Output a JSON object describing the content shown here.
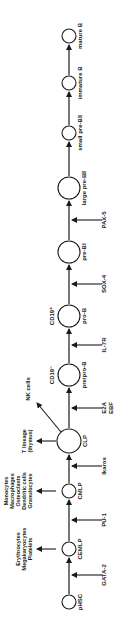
{
  "diagram": {
    "stages": [
      {
        "id": "pHSC",
        "label": "pHSC",
        "cy": 602,
        "r": 7
      },
      {
        "id": "CEMLP",
        "label": "CEMLP",
        "cy": 549,
        "r": 7
      },
      {
        "id": "CMLP",
        "label": "CMLP",
        "cy": 491,
        "r": 7
      },
      {
        "id": "CLP",
        "label": "CLP",
        "cy": 441,
        "r": 12
      },
      {
        "id": "prepro-B",
        "label": "pre/pro-B",
        "cy": 375,
        "r": 11,
        "marker": "CD19⁻"
      },
      {
        "id": "pro-B",
        "label": "pro-B",
        "cy": 316,
        "r": 11,
        "marker": "CD19⁺"
      },
      {
        "id": "pre-BI",
        "label": "pre-BⅠ",
        "cy": 252,
        "r": 11
      },
      {
        "id": "large-pre-BII",
        "label": "large pre-BⅡ",
        "cy": 188,
        "r": 11
      },
      {
        "id": "small-pre-BII",
        "label": "small pre-BⅡ",
        "cy": 133,
        "r": 7
      },
      {
        "id": "immature-B",
        "label": "immature B",
        "cy": 83,
        "r": 7
      },
      {
        "id": "mature-B",
        "label": "mature B",
        "cy": 36,
        "r": 7
      }
    ],
    "factors": [
      {
        "label": "GATA-2",
        "y": 575
      },
      {
        "label": "PU-1",
        "y": 520
      },
      {
        "label": "Ikaros",
        "y": 466
      },
      {
        "label": "E2A\nEBF",
        "y": 408
      },
      {
        "label": "IL-7R",
        "y": 345
      },
      {
        "label": "SOX-4",
        "y": 284
      },
      {
        "label": "PAX-5",
        "y": 220
      }
    ],
    "side_branches": [
      {
        "from": "CEMLP",
        "lines": [
          "Erythrocytes",
          "Megakaryocytes",
          "Platelets"
        ]
      },
      {
        "from": "CMLP",
        "lines": [
          "Monocytes",
          "Macrophages",
          "Osteoclasts",
          "Dendritic cells",
          "Granulocytes"
        ]
      },
      {
        "from": "CLP",
        "lines": [
          "T lineage",
          "(thymus)"
        ]
      },
      {
        "from": "CLP",
        "lines": [
          "NK cells"
        ]
      }
    ]
  }
}
